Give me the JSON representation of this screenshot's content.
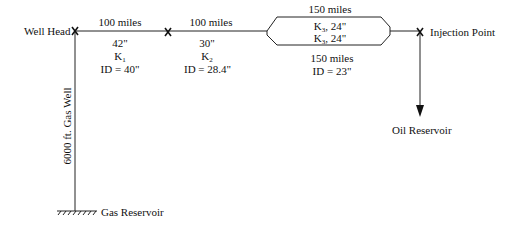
{
  "nodes": {
    "well_head": "Well Head",
    "injection_point": "Injection Point",
    "oil_reservoir": "Oil Reservoir",
    "gas_reservoir": "Gas Reservoir",
    "gas_well": "6000 ft. Gas Well"
  },
  "segments": [
    {
      "length": "100 miles",
      "od": "42\"",
      "k_label": "K",
      "k_sub": "1",
      "id": "ID = 40\""
    },
    {
      "length": "100 miles",
      "od": "30\"",
      "k_label": "K",
      "k_sub": "2",
      "id": "ID = 28.4\""
    },
    {
      "length_top": "150 miles",
      "line1_k": "K",
      "line1_sub": "3",
      "line1_size": ", 24\"",
      "line2_k": "K",
      "line2_sub": "3",
      "line2_size": ", 24\"",
      "length_bottom": "150 miles",
      "id": "ID = 23\""
    }
  ],
  "colors": {
    "line": "#222222",
    "text": "#111111"
  }
}
